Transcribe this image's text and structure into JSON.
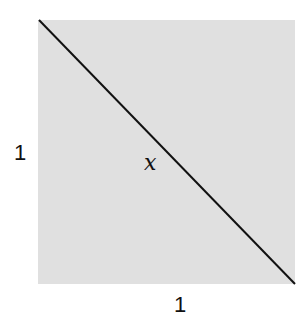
{
  "diagram": {
    "type": "unit-square-with-diagonal",
    "fill_color": "#e0e0e0",
    "line_color": "#111111",
    "labels": {
      "left_side": "1",
      "bottom_side": "1",
      "diagonal": "x"
    }
  }
}
